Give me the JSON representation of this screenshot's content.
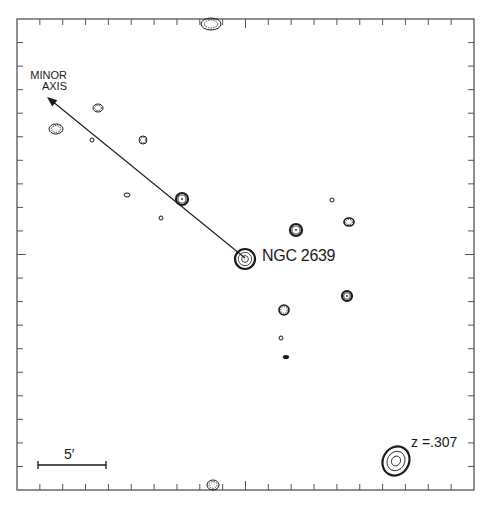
{
  "figure": {
    "type": "contour-map",
    "frame": {
      "left": 17,
      "top": 19,
      "right": 474,
      "bottom": 490
    },
    "tick_divisions": 20,
    "colors": {
      "ink": "#1a1a1a",
      "background": "#ffffff",
      "frame": "#555555"
    }
  },
  "labels": {
    "axis_line1": "MINOR",
    "axis_line2": "AXIS",
    "galaxy": "NGC 2639",
    "redshift": "z =.307",
    "scale_bar": "5′"
  },
  "arrow": {
    "from": [
      245,
      258
    ],
    "to": [
      47,
      97
    ],
    "name": "minor-axis-arrow"
  },
  "scale_bar": {
    "x1": 38,
    "x2": 106,
    "y": 465
  },
  "sources": [
    {
      "name": "source-top-edge",
      "x": 211,
      "y": 24,
      "rx": 10,
      "ry": 6,
      "levels": 2,
      "weight": "light"
    },
    {
      "name": "source-upper-left-1",
      "x": 56,
      "y": 129,
      "rx": 7,
      "ry": 5,
      "levels": 2,
      "weight": "light"
    },
    {
      "name": "source-upper-left-2",
      "x": 98,
      "y": 108,
      "rx": 5,
      "ry": 4,
      "levels": 2,
      "weight": "light"
    },
    {
      "name": "source-faint-1",
      "x": 92,
      "y": 140,
      "rx": 2,
      "ry": 2,
      "levels": 1,
      "weight": "light"
    },
    {
      "name": "source-left-3",
      "x": 143,
      "y": 140,
      "rx": 4,
      "ry": 4,
      "levels": 2,
      "weight": "light"
    },
    {
      "name": "source-faint-2",
      "x": 127,
      "y": 195,
      "rx": 3,
      "ry": 2,
      "levels": 1,
      "weight": "light"
    },
    {
      "name": "source-faint-3",
      "x": 161,
      "y": 218,
      "rx": 2,
      "ry": 2,
      "levels": 1,
      "weight": "light"
    },
    {
      "name": "source-on-arrow",
      "x": 182,
      "y": 199,
      "rx": 6,
      "ry": 6,
      "levels": 2,
      "weight": "bold"
    },
    {
      "name": "ngc2639",
      "x": 245,
      "y": 259,
      "rx": 10,
      "ry": 10,
      "levels": 3,
      "weight": "bold"
    },
    {
      "name": "source-right-1",
      "x": 296,
      "y": 230,
      "rx": 6,
      "ry": 6,
      "levels": 2,
      "weight": "bold"
    },
    {
      "name": "source-right-faint",
      "x": 332,
      "y": 200,
      "rx": 2,
      "ry": 2,
      "levels": 1,
      "weight": "light"
    },
    {
      "name": "source-right-2",
      "x": 349,
      "y": 222,
      "rx": 5,
      "ry": 4,
      "levels": 2,
      "weight": "medium"
    },
    {
      "name": "source-right-3",
      "x": 347,
      "y": 296,
      "rx": 5,
      "ry": 5,
      "levels": 2,
      "weight": "bold"
    },
    {
      "name": "source-lower-1",
      "x": 284,
      "y": 310,
      "rx": 5,
      "ry": 5,
      "levels": 2,
      "weight": "medium"
    },
    {
      "name": "source-lower-faint",
      "x": 281,
      "y": 338,
      "rx": 2,
      "ry": 2,
      "levels": 1,
      "weight": "light"
    },
    {
      "name": "source-lower-dot",
      "x": 286,
      "y": 357,
      "rx": 2,
      "ry": 1,
      "levels": 1,
      "weight": "bold"
    },
    {
      "name": "quasar-z0307",
      "x": 396,
      "y": 461,
      "rx": 13,
      "ry": 15,
      "levels": 3,
      "weight": "bold"
    },
    {
      "name": "source-bottom-edge",
      "x": 213,
      "y": 485,
      "rx": 6,
      "ry": 5,
      "levels": 2,
      "weight": "light"
    }
  ]
}
